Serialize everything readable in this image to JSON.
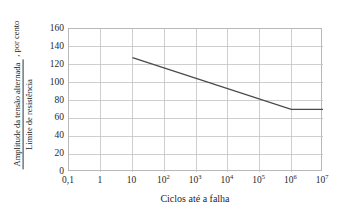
{
  "chart_data": {
    "type": "line",
    "title": "",
    "xlabel": "Ciclos até a falha",
    "ylabel_numerator": "Amplitude da tensão alternada",
    "ylabel_denominator": "Limite de resistência",
    "ylabel_suffix": ", por cento",
    "xscale": "log",
    "yscale": "linear",
    "xlim": [
      0.1,
      10000000
    ],
    "ylim": [
      0,
      160
    ],
    "grid": true,
    "legend": null,
    "x_tick_labels": [
      "0,1",
      "1",
      "10",
      "10²",
      "10³",
      "10⁴",
      "10⁵",
      "10⁶",
      "10⁷"
    ],
    "x_tick_bases": [
      "0,1",
      "1",
      "10",
      "10",
      "10",
      "10",
      "10",
      "10",
      "10"
    ],
    "x_tick_exponents": [
      "",
      "",
      "",
      "2",
      "3",
      "4",
      "5",
      "6",
      "7"
    ],
    "x_tick_values": [
      0.1,
      1,
      10,
      100,
      1000,
      10000,
      100000,
      1000000,
      10000000
    ],
    "y_tick_labels": [
      "160",
      "140",
      "120",
      "100",
      "80",
      "60",
      "40",
      "20",
      "0"
    ],
    "y_tick_values": [
      160,
      140,
      120,
      100,
      80,
      60,
      40,
      20,
      0
    ],
    "series": [
      {
        "name": "Curva S-N",
        "x": [
          10,
          1000000,
          10000000
        ],
        "y": [
          128,
          70,
          70
        ]
      }
    ]
  },
  "style": {
    "grid_color": "#c2c2c2",
    "axis_color": "#b9b9b9",
    "line_color": "#4a4a4a",
    "text_color": "#1f1f1f",
    "background": "#ffffff"
  }
}
